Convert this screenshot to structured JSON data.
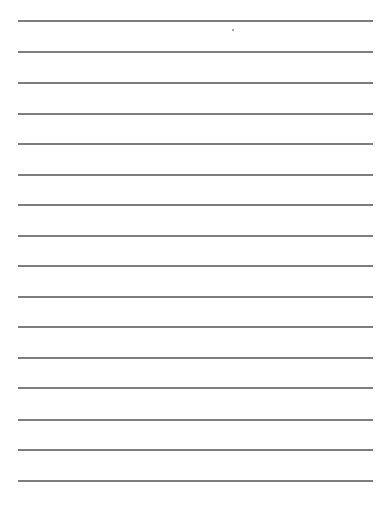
{
  "page": {
    "type": "lined-paper",
    "background_color": "#ffffff",
    "line_color": "#7d7d7d",
    "line_count": 16,
    "line_left": 18,
    "line_right": 373,
    "line_positions_y": [
      20,
      51,
      82,
      113,
      143,
      174,
      204,
      235,
      265,
      296,
      326,
      357,
      387,
      419,
      449,
      480
    ],
    "marks": [
      {
        "type": "dot",
        "x": 232,
        "y": 29
      }
    ]
  }
}
